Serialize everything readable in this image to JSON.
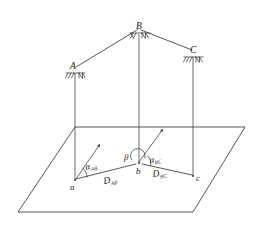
{
  "figure": {
    "type": "survey-traverse-diagram",
    "background_color": "#ffffff",
    "line_color": "#2b2b2b",
    "labels": {
      "station_a_upper": "A",
      "station_b_upper": "B",
      "station_c_upper": "C",
      "point_a_lower": "a",
      "point_b_lower": "b",
      "point_c_lower": "c",
      "azimuth_ab_base": "α",
      "azimuth_ab_sub": "AB",
      "azimuth_bc_base": "α",
      "azimuth_bc_sub": "BC",
      "angle_beta": "β",
      "distance_ab_base": "D",
      "distance_ab_sub": "AB",
      "distance_bc_base": "D",
      "distance_bc_sub": "BC"
    },
    "icons": {
      "station_a": "survey-tripod-icon",
      "station_b": "survey-tripod-icon",
      "station_c": "survey-tripod-icon",
      "north_arrow_a": "north-arrow-icon",
      "north_arrow_b": "north-arrow-icon"
    },
    "geometry": {
      "ground_plane": [
        [
          75,
          127
        ],
        [
          245,
          127
        ],
        [
          193,
          212
        ],
        [
          18,
          212
        ]
      ],
      "station_A": [
        75,
        66
      ],
      "station_B": [
        139,
        28
      ],
      "station_C": [
        193,
        51
      ],
      "point_a": [
        75,
        180
      ],
      "point_b": [
        139,
        163
      ],
      "point_c": [
        193,
        176
      ],
      "north_arrow_a_tip": [
        101,
        142
      ],
      "north_arrow_b_tip": [
        164,
        127
      ]
    }
  }
}
